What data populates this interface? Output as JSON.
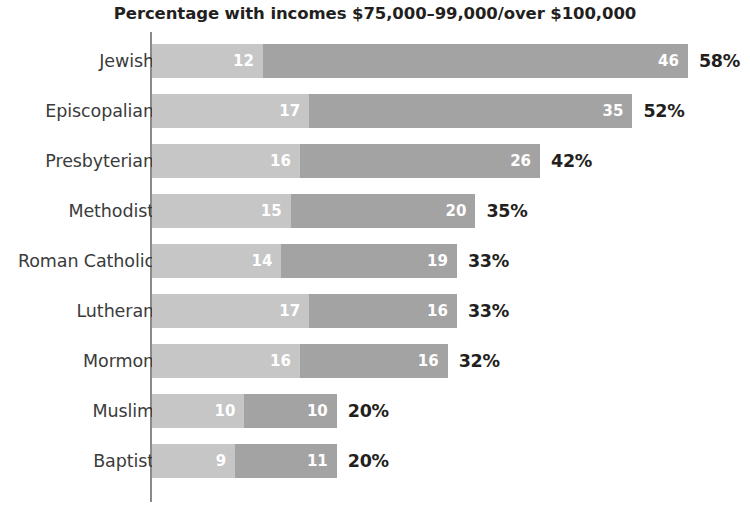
{
  "chart_data": {
    "type": "bar",
    "title": "Percentage with incomes $75,000–99,000/over $100,000",
    "xlabel": "",
    "ylabel": "",
    "orientation": "horizontal",
    "stacked": true,
    "grid": false,
    "legend": "none",
    "xlim": [
      0,
      58
    ],
    "px_per_unit": 9.24,
    "colors": {
      "segment_1": "#c6c6c6",
      "segment_2": "#a3a3a3",
      "axis": "#8a8a8a",
      "text": "#231f20",
      "category_text": "#3b3b3b",
      "value_text": "#ffffff"
    },
    "categories": [
      "Jewish",
      "Episcopalian",
      "Presbyterian",
      "Methodist",
      "Roman Catholic",
      "Lutheran",
      "Mormon",
      "Muslim",
      "Baptist"
    ],
    "series": [
      {
        "name": "$75,000–99,000",
        "values": [
          12,
          17,
          16,
          15,
          14,
          17,
          16,
          10,
          9
        ]
      },
      {
        "name": "over $100,000",
        "values": [
          46,
          35,
          26,
          20,
          19,
          16,
          16,
          10,
          11
        ]
      }
    ],
    "totals": [
      58,
      52,
      42,
      35,
      33,
      33,
      32,
      20,
      20
    ],
    "total_labels": [
      "58%",
      "52%",
      "42%",
      "35%",
      "33%",
      "33%",
      "32%",
      "20%",
      "20%"
    ],
    "rows": [
      {
        "label": "Jewish",
        "v1": 12,
        "v2": 46,
        "total": 58,
        "total_label": "58%"
      },
      {
        "label": "Episcopalian",
        "v1": 17,
        "v2": 35,
        "total": 52,
        "total_label": "52%"
      },
      {
        "label": "Presbyterian",
        "v1": 16,
        "v2": 26,
        "total": 42,
        "total_label": "42%"
      },
      {
        "label": "Methodist",
        "v1": 15,
        "v2": 20,
        "total": 35,
        "total_label": "35%"
      },
      {
        "label": "Roman Catholic",
        "v1": 14,
        "v2": 19,
        "total": 33,
        "total_label": "33%"
      },
      {
        "label": "Lutheran",
        "v1": 17,
        "v2": 16,
        "total": 33,
        "total_label": "33%"
      },
      {
        "label": "Mormon",
        "v1": 16,
        "v2": 16,
        "total": 32,
        "total_label": "32%"
      },
      {
        "label": "Muslim",
        "v1": 10,
        "v2": 10,
        "total": 20,
        "total_label": "20%"
      },
      {
        "label": "Baptist",
        "v1": 9,
        "v2": 11,
        "total": 20,
        "total_label": "20%"
      }
    ]
  }
}
